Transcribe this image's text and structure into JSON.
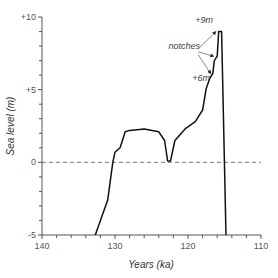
{
  "chart_data": {
    "type": "line",
    "title": "",
    "xlabel": "Years (ka)",
    "ylabel": "Sea level (m)",
    "xlim": [
      140,
      110
    ],
    "ylim": [
      -5,
      10
    ],
    "x_reversed": true,
    "grid": false,
    "x_ticks": [
      140,
      130,
      120,
      110
    ],
    "x_tick_labels": [
      "140",
      "130",
      "120",
      "110"
    ],
    "y_ticks": [
      10,
      5,
      0,
      -5
    ],
    "y_tick_labels": [
      "+10",
      "+5",
      "0",
      "-5"
    ],
    "reference_line": {
      "y": 0,
      "style": "dashed"
    },
    "series": [
      {
        "name": "Sea level",
        "x": [
          132.7,
          131,
          130.3,
          130,
          129.3,
          128.6,
          128,
          126,
          124,
          123.2,
          122.8,
          122.4,
          121.8,
          120.4,
          119,
          118,
          117.5,
          117,
          116.6,
          116.4,
          116,
          115.8,
          115.4,
          114.8
        ],
        "y": [
          -5,
          -2.6,
          0,
          0.7,
          1.0,
          2.1,
          2.2,
          2.3,
          2.1,
          1.5,
          0.1,
          0.1,
          1.5,
          2.3,
          2.8,
          3.6,
          5.1,
          5.8,
          6.1,
          7.0,
          7.3,
          9.0,
          9.0,
          -5
        ]
      }
    ],
    "annotations": [
      {
        "text": "+9m",
        "x": 117.8,
        "y": 9.6
      },
      {
        "text": "notches",
        "x": 120.5,
        "y": 7.8
      },
      {
        "text": "+6m",
        "x": 118.2,
        "y": 5.6
      }
    ],
    "arrows": [
      {
        "from": [
          118.6,
          7.8
        ],
        "to": [
          115.9,
          9.0
        ]
      },
      {
        "from": [
          118.6,
          7.6
        ],
        "to": [
          116.2,
          7.3
        ]
      },
      {
        "from": [
          118.6,
          7.4
        ],
        "to": [
          116.6,
          6.1
        ]
      }
    ]
  }
}
